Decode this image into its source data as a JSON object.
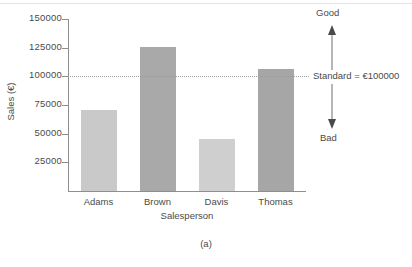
{
  "caption": "(a)",
  "chart_data": {
    "type": "bar",
    "title": "",
    "subtitle": "",
    "xlabel": "Salesperson",
    "ylabel": "Sales (€)",
    "categories": [
      "Adams",
      "Brown",
      "Davis",
      "Thomas"
    ],
    "values": [
      71000,
      126000,
      45000,
      106000
    ],
    "series": [
      {
        "name": "Sales",
        "values": [
          71000,
          126000,
          45000,
          106000
        ]
      }
    ],
    "bar_colors": [
      "#c9c9c9",
      "#a9a9a9",
      "#cfcfcf",
      "#a6a6a6"
    ],
    "ylim": [
      0,
      150000
    ],
    "yticks": [
      25000,
      50000,
      75000,
      100000,
      125000,
      150000
    ],
    "ytick_labels": [
      "25000",
      "50000",
      "75000",
      "100000",
      "125000",
      "150000"
    ],
    "grid": false,
    "legend": "none",
    "reference_line": {
      "value": 100000,
      "label": "Standard = €100000",
      "style": "dotted"
    },
    "annotations": [
      {
        "label": "Good",
        "direction": "up"
      },
      {
        "label": "Bad",
        "direction": "down"
      }
    ]
  }
}
